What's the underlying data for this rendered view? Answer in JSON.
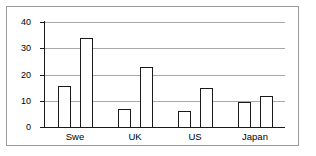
{
  "chart_data": {
    "type": "bar",
    "title": "",
    "xlabel": "",
    "ylabel": "",
    "categories": [
      "Swe",
      "UK",
      "US",
      "Japan"
    ],
    "series": [
      {
        "name": "Series 1",
        "values": [
          15.5,
          7.0,
          6.2,
          9.7
        ]
      },
      {
        "name": "Series 2",
        "values": [
          34.0,
          22.7,
          15.0,
          11.7
        ]
      }
    ],
    "ylim": [
      0,
      40
    ],
    "yticks": [
      0,
      10,
      20,
      30,
      40
    ],
    "ytick_labels": [
      "0",
      "10",
      "20",
      "30",
      "40"
    ],
    "grid": true,
    "grid_axis": "y",
    "legend": false,
    "bar_fill": "#ffffff",
    "bar_edge": "#1a1a1a",
    "grid_color": "#a8a8a8",
    "axis_color": "#1a1a1a",
    "frame_color": "#9a9a9a",
    "background": "#ffffff"
  }
}
